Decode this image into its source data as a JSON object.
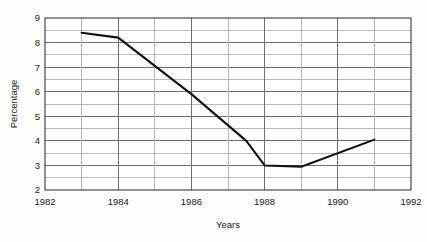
{
  "chart_data": {
    "type": "line",
    "title": "",
    "xlabel": "Years",
    "ylabel": "Percentage",
    "xlim": [
      1982,
      1992
    ],
    "ylim": [
      2,
      9
    ],
    "grid": true,
    "legend": "none",
    "x_ticks": [
      1982,
      1984,
      1986,
      1988,
      1990,
      1992
    ],
    "x_tick_labels": [
      "1982",
      "1984",
      "1986",
      "1988",
      "1990",
      "1992"
    ],
    "x_minor_ticks": [
      1983,
      1985,
      1987,
      1989,
      1991
    ],
    "y_ticks": [
      2,
      3,
      4,
      5,
      6,
      7,
      8,
      9
    ],
    "y_tick_labels": [
      "2",
      "3",
      "4",
      "5",
      "6",
      "7",
      "8",
      "9"
    ],
    "y_minor_ticks": [
      2.5,
      3.5,
      4.5,
      5.5,
      6.5,
      7.5,
      8.5
    ],
    "series": [
      {
        "name": "Percentage",
        "color": "#111111",
        "x": [
          1983,
          1984,
          1986,
          1987.5,
          1988,
          1989,
          1991
        ],
        "values": [
          8.4,
          8.2,
          5.9,
          4.0,
          3.0,
          2.95,
          4.05
        ]
      }
    ]
  },
  "axis": {
    "y_title": "Percentage",
    "x_title": "Years"
  },
  "ticks": {
    "x": [
      "1982",
      "1984",
      "1986",
      "1988",
      "1990",
      "1992"
    ],
    "y": [
      "9",
      "8",
      "7",
      "6",
      "5",
      "4",
      "3",
      "2"
    ]
  },
  "colors": {
    "line": "#111111",
    "major_grid": "#6f6f6f",
    "minor_grid": "#b8b8b8",
    "frame": "#3a3a3a",
    "background": "#fdfdfc",
    "text": "#1a1a1a"
  }
}
